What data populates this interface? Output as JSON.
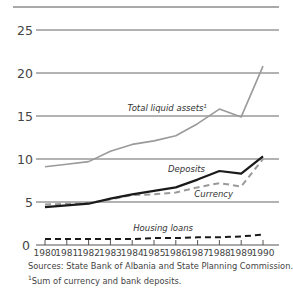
{
  "chart_data": {
    "type": "line",
    "title": "",
    "xlabel": "",
    "ylabel": "",
    "x": [
      1980,
      1981,
      1982,
      1983,
      1984,
      1985,
      1986,
      1987,
      1988,
      1989,
      1990
    ],
    "x_tick_labels": [
      "1980",
      "1981",
      "1982",
      "1983",
      "1984",
      "1985",
      "1986",
      "1987",
      "1988",
      "1989",
      "1990"
    ],
    "y_ticks": [
      0,
      5,
      10,
      15,
      20,
      25
    ],
    "y_tick_labels": [
      "0",
      "5",
      "10",
      "15",
      "20",
      "25"
    ],
    "ylim": [
      0,
      25
    ],
    "xlim": [
      1980,
      1990
    ],
    "grid": "horizontal",
    "series": [
      {
        "name": "Total liquid assets",
        "label": "Total liquid assets",
        "footnote_mark": "1",
        "style": "solid",
        "color": "#9a9a9a",
        "values": [
          9.1,
          9.4,
          9.7,
          10.9,
          11.7,
          12.1,
          12.7,
          14.1,
          15.8,
          14.9,
          20.8
        ]
      },
      {
        "name": "Deposits",
        "label": "Deposits",
        "style": "solid",
        "color": "#1a1a1a",
        "values": [
          4.4,
          4.6,
          4.8,
          5.4,
          5.9,
          6.3,
          6.7,
          7.6,
          8.6,
          8.3,
          10.3
        ]
      },
      {
        "name": "Currency",
        "label": "Currency",
        "style": "dashed",
        "color": "#9a9a9a",
        "values": [
          4.7,
          4.8,
          4.9,
          5.3,
          5.8,
          5.9,
          6.1,
          6.7,
          7.2,
          6.8,
          10.0
        ]
      },
      {
        "name": "Housing loans",
        "label": "Housing loans",
        "style": "dashed",
        "color": "#1a1a1a",
        "values": [
          0.7,
          0.7,
          0.7,
          0.7,
          0.7,
          0.8,
          0.8,
          0.9,
          0.9,
          1.0,
          1.2
        ]
      }
    ]
  },
  "footer": {
    "sources": "Sources:  State Bank of Albania and State Planning Commission.",
    "footnote_mark": "1",
    "footnote": "Sum of currency and bank deposits."
  }
}
